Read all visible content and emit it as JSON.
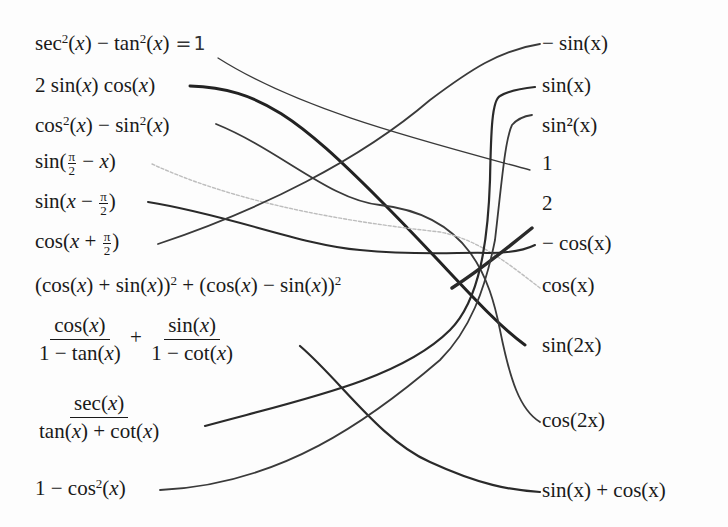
{
  "worksheet": {
    "left": [
      {
        "id": "L1",
        "text": "sec²(x) − tan²(x)",
        "annotation": "=1",
        "match": "R4"
      },
      {
        "id": "L2",
        "text": "2 sin(x) cos(x)",
        "match": "R8"
      },
      {
        "id": "L3",
        "text": "cos²(x) − sin²(x)",
        "match": "R9"
      },
      {
        "id": "L4",
        "text": "sin(π/2 − x)",
        "match": "R7"
      },
      {
        "id": "L5",
        "text": "sin(x − π/2)",
        "match": "R6"
      },
      {
        "id": "L6",
        "text": "cos(x + π/2)",
        "match": "R1"
      },
      {
        "id": "L7",
        "text": "(cos(x) + sin(x))² + (cos(x) − sin(x))²",
        "match": "R5"
      },
      {
        "id": "L8",
        "text": "cos(x)/(1 − tan(x)) + sin(x)/(1 − cot(x))",
        "match": "R10"
      },
      {
        "id": "L9",
        "text": "sec(x)/(tan(x) + cot(x))",
        "match": "R2"
      },
      {
        "id": "L10",
        "text": "1 − cos²(x)",
        "match": "R3"
      }
    ],
    "right": [
      {
        "id": "R1",
        "text": "− sin(x)"
      },
      {
        "id": "R2",
        "text": "sin(x)"
      },
      {
        "id": "R3",
        "text": "sin²(x)"
      },
      {
        "id": "R4",
        "text": "1"
      },
      {
        "id": "R5",
        "text": "2"
      },
      {
        "id": "R6",
        "text": "− cos(x)"
      },
      {
        "id": "R7",
        "text": "cos(x)"
      },
      {
        "id": "R8",
        "text": "sin(2x)"
      },
      {
        "id": "R9",
        "text": "cos(2x)"
      },
      {
        "id": "R10",
        "text": "sin(x) + cos(x)"
      }
    ],
    "ink_color": "#2a2a2a",
    "faint_ink_color": "#b8b8b8"
  }
}
